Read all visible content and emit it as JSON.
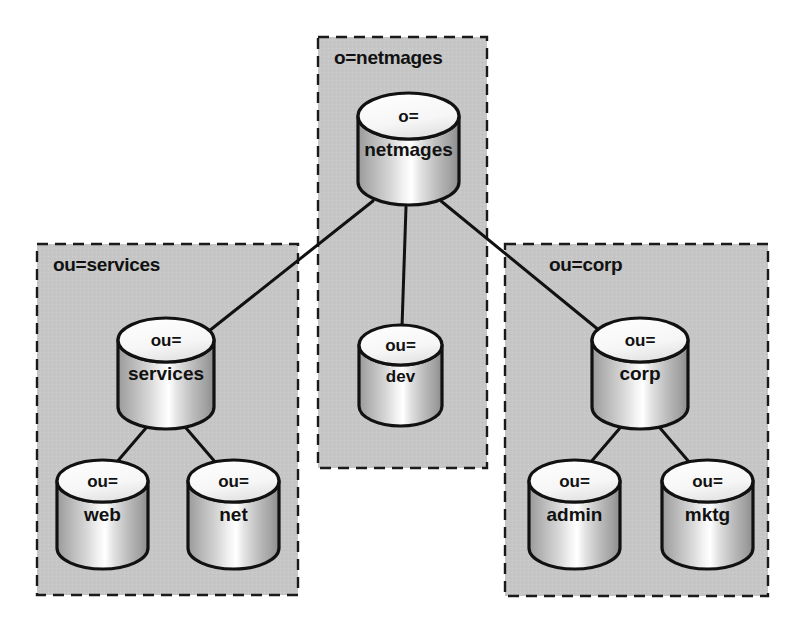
{
  "diagram": {
    "canvas": {
      "width": 801,
      "height": 635
    },
    "colors": {
      "page_background": "#ffffff",
      "group_fill": "#c6c6c6",
      "group_border": "#1a1a1a",
      "node_outline": "#111111",
      "node_top_fill": "#f4f4f4",
      "node_body_light": "#ffffff",
      "node_body_mid": "#c4c4c4",
      "node_body_dark": "#8e8e8e",
      "connector": "#111111"
    },
    "groups": [
      {
        "id": "group-netmages",
        "label": "o=netmages",
        "x": 318,
        "y": 37,
        "width": 169,
        "height": 431,
        "label_x": 334,
        "label_y": 64
      },
      {
        "id": "group-services",
        "label": "ou=services",
        "x": 37,
        "y": 244,
        "width": 261,
        "height": 351,
        "label_x": 53,
        "label_y": 271
      },
      {
        "id": "group-corp",
        "label": "ou=corp",
        "x": 505,
        "y": 244,
        "width": 263,
        "height": 352,
        "label_x": 549,
        "label_y": 271
      }
    ],
    "nodes": [
      {
        "id": "node-netmages",
        "top_label": "o=",
        "body_label": "netmages",
        "x": 358,
        "y": 93,
        "width": 101,
        "height": 112,
        "rim": 23,
        "size": "large"
      },
      {
        "id": "node-services",
        "top_label": "ou=",
        "body_label": "services",
        "x": 118,
        "y": 318,
        "width": 96,
        "height": 111,
        "rim": 22,
        "size": "large"
      },
      {
        "id": "node-dev",
        "top_label": "ou=",
        "body_label": "dev",
        "x": 359,
        "y": 325,
        "width": 83,
        "height": 101,
        "rim": 20,
        "size": "small"
      },
      {
        "id": "node-corp",
        "top_label": "ou=",
        "body_label": "corp",
        "x": 592,
        "y": 318,
        "width": 96,
        "height": 111,
        "rim": 22,
        "size": "large"
      },
      {
        "id": "node-web",
        "top_label": "ou=",
        "body_label": "web",
        "x": 57,
        "y": 460,
        "width": 91,
        "height": 109,
        "rim": 21,
        "size": "large"
      },
      {
        "id": "node-net",
        "top_label": "ou=",
        "body_label": "net",
        "x": 188,
        "y": 460,
        "width": 91,
        "height": 109,
        "rim": 21,
        "size": "large"
      },
      {
        "id": "node-admin",
        "top_label": "ou=",
        "body_label": "admin",
        "x": 529,
        "y": 460,
        "width": 91,
        "height": 109,
        "rim": 21,
        "size": "large"
      },
      {
        "id": "node-mktg",
        "top_label": "ou=",
        "body_label": "mktg",
        "x": 662,
        "y": 460,
        "width": 91,
        "height": 109,
        "rim": 21,
        "size": "large"
      }
    ],
    "connectors": [
      {
        "id": "edge-netmages-services",
        "from": "node-netmages",
        "to": "node-services",
        "x1": 373,
        "y1": 201,
        "x2": 209,
        "y2": 331
      },
      {
        "id": "edge-netmages-dev",
        "from": "node-netmages",
        "to": "node-dev",
        "x1": 406,
        "y1": 207,
        "x2": 402,
        "y2": 327
      },
      {
        "id": "edge-netmages-corp",
        "from": "node-netmages",
        "to": "node-corp",
        "x1": 441,
        "y1": 201,
        "x2": 600,
        "y2": 331
      },
      {
        "id": "edge-services-web",
        "from": "node-services",
        "to": "node-web",
        "x1": 146,
        "y1": 428,
        "x2": 116,
        "y2": 463
      },
      {
        "id": "edge-services-net",
        "from": "node-services",
        "to": "node-net",
        "x1": 186,
        "y1": 428,
        "x2": 216,
        "y2": 463
      },
      {
        "id": "edge-corp-admin",
        "from": "node-corp",
        "to": "node-admin",
        "x1": 620,
        "y1": 428,
        "x2": 590,
        "y2": 463
      },
      {
        "id": "edge-corp-mktg",
        "from": "node-corp",
        "to": "node-mktg",
        "x1": 660,
        "y1": 428,
        "x2": 690,
        "y2": 463
      }
    ]
  }
}
